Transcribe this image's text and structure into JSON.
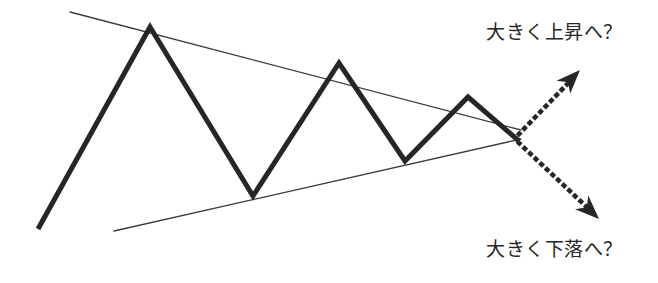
{
  "figure": {
    "type": "technical-analysis-chart-diagram",
    "pattern_name": "symmetrical-triangle",
    "background_color": "#ffffff",
    "canvas": {
      "width": 658,
      "height": 283
    }
  },
  "annotations": {
    "upper_label": {
      "text": "大きく上昇へ？",
      "name": "breakout-up-label",
      "x": 486,
      "y": 17,
      "color": "#262626"
    },
    "lower_label": {
      "text": "大きく下落へ？",
      "name": "breakout-down-label",
      "x": 486,
      "y": 234,
      "color": "#262626"
    }
  },
  "chart_data": {
    "type": "line",
    "title": "",
    "xlabel": "",
    "ylabel": "",
    "grid": false,
    "legend": null,
    "xlim": [
      0,
      658
    ],
    "ylim": [
      0,
      283
    ],
    "series": [
      {
        "name": "price-zigzag",
        "role": "price-action",
        "stroke": "#262626",
        "stroke_width": 5,
        "points": [
          [
            38,
            229
          ],
          [
            150,
            27
          ],
          [
            253,
            196
          ],
          [
            339,
            63
          ],
          [
            405,
            161
          ],
          [
            468,
            97
          ],
          [
            519,
            141
          ]
        ]
      },
      {
        "name": "upper-trendline",
        "role": "resistance-descending",
        "stroke": "#3a3a3a",
        "stroke_width": 1.3,
        "points": [
          [
            70,
            12
          ],
          [
            521,
            130
          ]
        ]
      },
      {
        "name": "lower-trendline",
        "role": "support-ascending",
        "stroke": "#3a3a3a",
        "stroke_width": 1.3,
        "points": [
          [
            114,
            231
          ],
          [
            521,
            139
          ]
        ]
      },
      {
        "name": "breakout-up-arrow",
        "role": "projection-bullish",
        "style": "dotted",
        "stroke": "#262626",
        "stroke_width": 4.5,
        "points": [
          [
            519,
            134
          ],
          [
            575,
            76
          ]
        ],
        "arrowhead": {
          "x": 580,
          "y": 70,
          "angle_deg": -46
        }
      },
      {
        "name": "breakout-down-arrow",
        "role": "projection-bearish",
        "style": "dotted",
        "stroke": "#262626",
        "stroke_width": 4.5,
        "points": [
          [
            519,
            143
          ],
          [
            592,
            212
          ]
        ],
        "arrowhead": {
          "x": 599,
          "y": 219,
          "angle_deg": 44
        }
      }
    ]
  }
}
